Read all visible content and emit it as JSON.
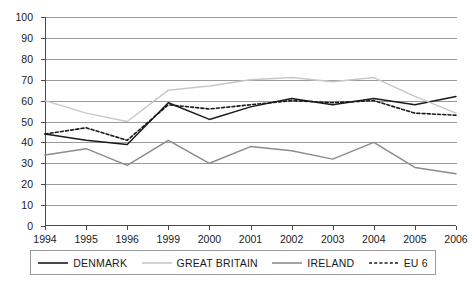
{
  "chart_data": {
    "type": "line",
    "title": "",
    "xlabel": "",
    "ylabel": "",
    "grid": true,
    "legend_position": "bottom",
    "categories": [
      "1994",
      "1995",
      "1996",
      "1999",
      "2000",
      "2001",
      "2002",
      "2003",
      "2004",
      "2005",
      "2006"
    ],
    "x": [
      "1994",
      "1995",
      "1996",
      "1999",
      "2000",
      "2001",
      "2002",
      "2003",
      "2004",
      "2005",
      "2006"
    ],
    "ylim": [
      0,
      100
    ],
    "yticks": [
      0,
      10,
      20,
      30,
      40,
      50,
      60,
      70,
      80,
      90,
      100
    ],
    "ytick_labels": [
      "0",
      "10",
      "20",
      "30",
      "40",
      "50",
      "60",
      "70",
      "80",
      "90",
      "100"
    ],
    "series": [
      {
        "name": "DENMARK",
        "style": "solid",
        "color": "#1a1a1a",
        "values": [
          44,
          41,
          39,
          59,
          51,
          57,
          61,
          58,
          61,
          58,
          62
        ]
      },
      {
        "name": "GREAT BRITAIN",
        "style": "solid",
        "color": "#c8c8c8",
        "values": [
          60,
          54,
          50,
          65,
          67,
          70,
          71,
          69,
          71,
          62,
          54
        ]
      },
      {
        "name": "IRELAND",
        "style": "solid",
        "color": "#8c8c8c",
        "values": [
          34,
          37,
          29,
          41,
          30,
          38,
          36,
          32,
          40,
          28,
          25
        ]
      },
      {
        "name": "EU 6",
        "style": "dashed",
        "color": "#1a1a1a",
        "values": [
          44,
          47,
          41,
          58,
          56,
          58,
          60,
          59,
          60,
          54,
          53
        ]
      }
    ]
  },
  "legend": {
    "items": [
      {
        "label": "DENMARK",
        "color": "#1a1a1a",
        "style": "solid"
      },
      {
        "label": "GREAT BRITAIN",
        "color": "#c8c8c8",
        "style": "solid"
      },
      {
        "label": "IRELAND",
        "color": "#8c8c8c",
        "style": "solid"
      },
      {
        "label": "EU 6",
        "color": "#1a1a1a",
        "style": "dashed"
      }
    ]
  },
  "colors": {
    "axis": "#4a4a4a",
    "grid": "#9a9a9a",
    "background": "#ffffff",
    "text": "#1a1a1a"
  }
}
